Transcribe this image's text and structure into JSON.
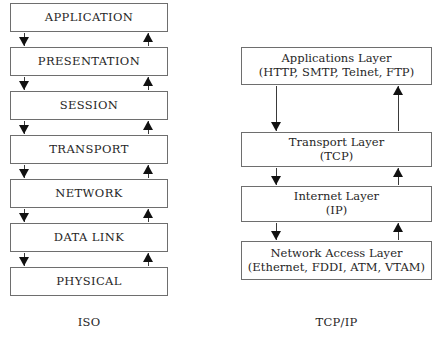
{
  "diagram": {
    "title_hidden": "",
    "columns": [
      {
        "id": "iso",
        "label": "ISO",
        "layers": [
          {
            "name": "APPLICATION"
          },
          {
            "name": "PRESENTATION"
          },
          {
            "name": "SESSION"
          },
          {
            "name": "TRANSPORT"
          },
          {
            "name": "NETWORK"
          },
          {
            "name": "DATA LINK"
          },
          {
            "name": "PHYSICAL"
          }
        ]
      },
      {
        "id": "tcpip",
        "label": "TCP/IP",
        "layers": [
          {
            "name": "Applications Layer",
            "detail": "(HTTP, SMTP, Telnet, FTP)"
          },
          {
            "name": "Transport Layer",
            "detail": "(TCP)"
          },
          {
            "name": "Internet Layer",
            "detail": "(IP)"
          },
          {
            "name": "Network Access Layer",
            "detail": "(Ethernet, FDDI, ATM, VTAM)"
          }
        ]
      }
    ],
    "connectors": {
      "down_arrow_name": "down-arrow-icon",
      "up_arrow_name": "up-arrow-icon"
    },
    "colors": {
      "box_border": "#6e6e6e",
      "box_fill": "#ffffff",
      "arrow": "#111111",
      "text": "#262626",
      "page_background": "#ffffff"
    }
  }
}
